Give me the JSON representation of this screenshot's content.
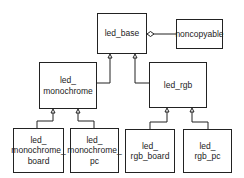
{
  "diagram": {
    "type": "uml-class-diagram",
    "nodes": {
      "led_base": {
        "label": "led_base"
      },
      "noncopyable": {
        "label": "noncopyable"
      },
      "led_monochrome": {
        "label": "led_\nmonochrome"
      },
      "led_rgb": {
        "label": "led_rgb"
      },
      "led_monochrome_board": {
        "label": "led_\nmonochrome_\nboard"
      },
      "led_monochrome_pc": {
        "label": "led_\nmonochrome_\npc"
      },
      "led_rgb_board": {
        "label": "led_\nrgb_board"
      },
      "led_rgb_pc": {
        "label": "led_\nrgb_pc"
      }
    },
    "edges": [
      {
        "from": "led_monochrome",
        "to": "led_base",
        "type": "inheritance"
      },
      {
        "from": "led_rgb",
        "to": "led_base",
        "type": "inheritance"
      },
      {
        "from": "noncopyable",
        "to": "led_base",
        "type": "aggregation"
      },
      {
        "from": "led_monochrome_board",
        "to": "led_monochrome",
        "type": "inheritance"
      },
      {
        "from": "led_monochrome_pc",
        "to": "led_monochrome",
        "type": "inheritance"
      },
      {
        "from": "led_rgb_board",
        "to": "led_rgb",
        "type": "inheritance"
      },
      {
        "from": "led_rgb_pc",
        "to": "led_rgb",
        "type": "inheritance"
      }
    ]
  }
}
